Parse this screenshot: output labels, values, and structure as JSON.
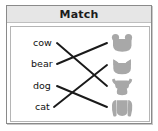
{
  "card": {
    "header": {
      "title": "Match"
    },
    "border_color": "#8a8a8a",
    "header_bg": "#e6e6e6",
    "background": "#ffffff"
  },
  "exercise": {
    "type": "matching",
    "instruction_label": "Match",
    "line_color": "#1a1a1a",
    "silhouette_color": "#a8a8a8",
    "words": [
      {
        "id": "cow",
        "label": "cow",
        "x": 26,
        "y": 32
      },
      {
        "id": "bear",
        "label": "bear",
        "x": 24,
        "y": 53
      },
      {
        "id": "dog",
        "label": "dog",
        "x": 26,
        "y": 75
      },
      {
        "id": "cat",
        "label": "cat",
        "x": 28,
        "y": 96
      }
    ],
    "pictures": [
      {
        "id": "pic-bear",
        "icon": "bear-head-icon",
        "x": 106,
        "y": 28
      },
      {
        "id": "pic-cat",
        "icon": "cat-head-icon",
        "x": 106,
        "y": 50
      },
      {
        "id": "pic-cow",
        "icon": "cow-head-icon",
        "x": 106,
        "y": 71
      },
      {
        "id": "pic-dog",
        "icon": "dog-head-icon",
        "x": 106,
        "y": 92
      }
    ],
    "connections": [
      {
        "from": "cow",
        "to": "pic-cow",
        "x1": 50,
        "y1": 37,
        "x2": 100,
        "y2": 80
      },
      {
        "from": "bear",
        "to": "pic-bear",
        "x1": 50,
        "y1": 58,
        "x2": 100,
        "y2": 37
      },
      {
        "from": "dog",
        "to": "pic-dog",
        "x1": 50,
        "y1": 80,
        "x2": 100,
        "y2": 101
      },
      {
        "from": "cat",
        "to": "pic-cat",
        "x1": 47,
        "y1": 101,
        "x2": 100,
        "y2": 59
      }
    ]
  }
}
